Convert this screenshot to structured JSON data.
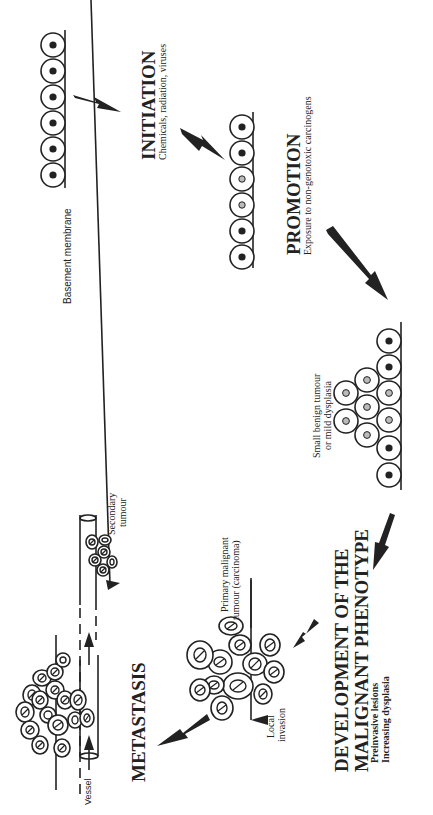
{
  "diagram": {
    "orientation": "rotated-90-ccw",
    "stages": [
      {
        "id": "initiation",
        "title": "INITIATION",
        "subtitle": "Chemicals, radiation, viruses"
      },
      {
        "id": "promotion",
        "title": "PROMOTION",
        "subtitle": "Exposure to non-genotoxic carcinogens"
      },
      {
        "id": "malignant",
        "title_line1": "DEVELOPMENT OF THE",
        "title_line2": "MALIGNANT PHENOTYPE",
        "subtitle_line1": "Preinvasive lesions",
        "subtitle_line2": "Increasing dysplasia"
      },
      {
        "id": "metastasis",
        "title": "METASTASIS"
      }
    ],
    "labels": {
      "basement_membrane": "Basement membrane",
      "benign_line1": "Small benign tumour",
      "benign_line2": "or mild dysplasia",
      "primary_line1": "Primary malignant",
      "primary_line2": "tumour (carcinoma)",
      "local_line1": "Local",
      "local_line2": "invasion",
      "secondary_line1": "Secondary",
      "secondary_line2": "tumour",
      "vessel": "Vessel"
    },
    "colors": {
      "ink": "#222222",
      "background": "#ffffff",
      "grey_nucleus": "#bbbbbb"
    }
  }
}
